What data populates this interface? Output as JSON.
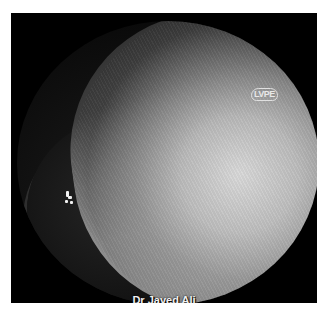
{
  "image": {
    "type": "endoscopic-view",
    "background_color": "#000000",
    "frame_color": "#ffffff"
  },
  "labels": {
    "logo_text": "LVPE",
    "credit": "Dr Javed Ali"
  }
}
